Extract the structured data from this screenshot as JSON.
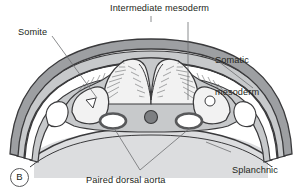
{
  "figure": {
    "panel_letter": "B",
    "labels": {
      "intermediate_mesoderm": "Intermediate mesoderm",
      "somite": "Somite",
      "somatic_mesoderm_line1": "Somatic",
      "somatic_mesoderm_line2": "mesoderm",
      "splanchnic_mesoderm_line1": "Splanchnic",
      "splanchnic_mesoderm_line2": "mesoderm",
      "paired_dorsal_aorta": "Paired dorsal aorta"
    },
    "colors": {
      "outline": "#3a3a3c",
      "text": "#231f20",
      "leader_line": "#6d6e71",
      "amnion_fill": "#9d9fa2",
      "mesoderm_fill": "#c7c9cb",
      "neural_fill": "#f2f2f2",
      "yolk_sac_fill": "#dcdddf",
      "notochord_fill": "#7d7f82",
      "aorta_ring": "#58595b",
      "background": "#ffffff"
    },
    "structures": [
      {
        "name": "amnion",
        "description": "outer arching double membrane over embryo"
      },
      {
        "name": "ectoderm",
        "description": "surface layer lining the embryo"
      },
      {
        "name": "neural-groove",
        "description": "midline invagination with radial columnar hatching"
      },
      {
        "name": "somite-left",
        "description": "paraxial mesoderm block with triangular cavity"
      },
      {
        "name": "somite-right",
        "description": "paraxial mesoderm block with round cavity"
      },
      {
        "name": "notochord",
        "description": "dark round midline rod"
      },
      {
        "name": "dorsal-aorta-left",
        "description": "dark ringed vessel lumen"
      },
      {
        "name": "dorsal-aorta-right",
        "description": "dark ringed vessel lumen"
      },
      {
        "name": "intraembryonic-coelom",
        "description": "cavity splitting lateral plate mesoderm"
      },
      {
        "name": "somatic-mesoderm",
        "description": "outer layer of lateral plate mesoderm"
      },
      {
        "name": "splanchnic-mesoderm",
        "description": "inner layer of lateral plate mesoderm"
      },
      {
        "name": "yolk-sac",
        "description": "light gray mass beneath the embryo"
      },
      {
        "name": "endoderm",
        "description": "innermost layer roofing the yolk sac"
      }
    ]
  }
}
